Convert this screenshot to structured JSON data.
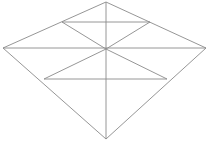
{
  "figure": {
    "canvas": {
      "width": 209,
      "height": 142,
      "background_color": "#ffffff"
    },
    "style": {
      "stroke_color": "#8a8a8a",
      "stroke_width": 0.9,
      "fill": "none"
    },
    "vertices": {
      "top": {
        "label": "top-vertex",
        "x": 106,
        "y": 2
      },
      "right": {
        "label": "right-vertex",
        "x": 206,
        "y": 48
      },
      "bottom": {
        "label": "bottom-vertex",
        "x": 106,
        "y": 139
      },
      "left": {
        "label": "left-vertex",
        "x": 3,
        "y": 48
      },
      "center": {
        "label": "center-point",
        "x": 106,
        "y": 49
      },
      "upper_chord_left": {
        "label": "upper-chord-left-end",
        "x": 62,
        "y": 22
      },
      "upper_chord_right": {
        "label": "upper-chord-right-end",
        "x": 150,
        "y": 22
      },
      "lower_chord_left": {
        "label": "lower-chord-left-end",
        "x": 44,
        "y": 79
      },
      "lower_chord_right": {
        "label": "lower-chord-right-end",
        "x": 167,
        "y": 79
      }
    },
    "paths": {
      "outer_diamond": "M 106 2 L 206 48 L 106 139 L 3 48 Z",
      "horizontal_diagonal": "M 3 48 L 206 48",
      "vertical_diagonal": "M 106 2 L 106 139",
      "spoke_center_to_upper_left": "M 106 49 L 62 22",
      "spoke_center_to_upper_right": "M 106 49 L 150 22",
      "spoke_center_to_lower_left": "M 106 49 L 44 79",
      "spoke_center_to_lower_right": "M 106 49 L 167 79",
      "upper_chord": "M 62 22 L 150 22",
      "lower_chord": "M 44 79 L 167 79"
    },
    "caption": ""
  }
}
